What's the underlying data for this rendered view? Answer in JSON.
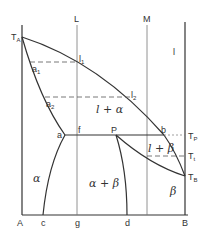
{
  "diagram": {
    "type": "binary eutectic/peritectic phase diagram",
    "axes": {
      "left": "A",
      "right": "B"
    },
    "vertical_lines": [
      {
        "label": "L",
        "bottom_label": "g"
      },
      {
        "label": "M"
      }
    ],
    "temperatures": {
      "TA": {
        "main": "T",
        "sub": "A"
      },
      "TB": {
        "main": "T",
        "sub": "B"
      },
      "TP": {
        "main": "T",
        "sub": "P"
      },
      "Tt": {
        "main": "T",
        "sub": "t"
      }
    },
    "points": {
      "a1": {
        "main": "a",
        "sub": "1"
      },
      "a2": {
        "main": "a",
        "sub": "2"
      },
      "l1": {
        "main": "l",
        "sub": "1"
      },
      "l2": {
        "main": "l",
        "sub": "2"
      },
      "a": "a",
      "f": "f",
      "P": "P",
      "b": "b",
      "c": "c",
      "d": "d"
    },
    "regions": {
      "liquid": "l",
      "liquid_alpha": "l + α",
      "liquid_beta": "l + β",
      "alpha": "α",
      "alpha_beta": "α + β",
      "beta": "β"
    },
    "colors": {
      "line": "#333333",
      "thin": "#555555"
    }
  }
}
